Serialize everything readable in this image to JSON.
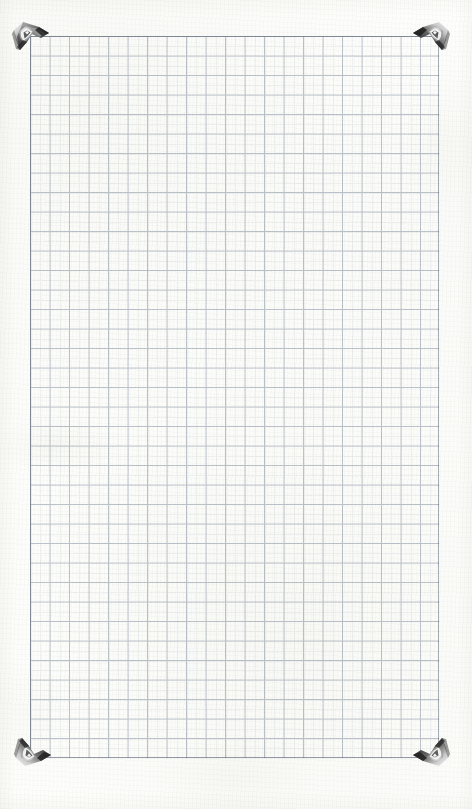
{
  "scan": {
    "subject": "graph-paper-sheet",
    "width": 472,
    "height": 809,
    "background_color": "#fdfdfc",
    "paper_tint": "#fcfcfa",
    "caption": ""
  },
  "grid": {
    "label": "grid-paper",
    "left": 30,
    "top": 36,
    "width": 409,
    "height": 722,
    "cell_size": 19.5,
    "columns": 21,
    "rows": 37,
    "line_color": "#c9ced6",
    "line_width": 1,
    "border_color": "#a9b0ba",
    "border_width": 1,
    "ghost_line_color": "#dfe3e9"
  },
  "corners": {
    "label": "metal-photo-corner-clips",
    "count": 4,
    "metal_light": "#f2f2f2",
    "metal_mid": "#9a9a9a",
    "metal_dark": "#2a2a2a",
    "metal_shadow": "#6e6e6e",
    "items": [
      {
        "name": "corner-clip-top-left",
        "position": "top-left",
        "x": 8,
        "y": 16
      },
      {
        "name": "corner-clip-top-right",
        "position": "top-right",
        "x": 408,
        "y": 16
      },
      {
        "name": "corner-clip-bottom-left",
        "position": "bottom-left",
        "x": 10,
        "y": 726
      },
      {
        "name": "corner-clip-bottom-right",
        "position": "bottom-right",
        "x": 408,
        "y": 726
      }
    ]
  }
}
